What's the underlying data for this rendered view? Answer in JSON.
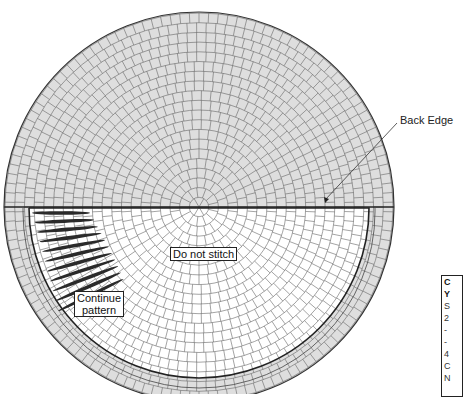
{
  "diagram": {
    "type": "circular stitch pattern / radial grid",
    "colors": {
      "grid_fill_outer": "#dedede",
      "grid_fill_inner": "#ffffff",
      "grid_line": "#555555",
      "outline": "#222222",
      "stitch": "#2a2a2a"
    },
    "callout": {
      "label": "Back Edge"
    },
    "labels": {
      "do_not_stitch": "Do not stitch",
      "continue_pattern_line1": "Continue",
      "continue_pattern_line2": "pattern"
    },
    "legend_partial": {
      "lines": [
        "C",
        "Y",
        "S",
        "2",
        "-",
        "-",
        "4",
        "C",
        "N"
      ]
    }
  }
}
